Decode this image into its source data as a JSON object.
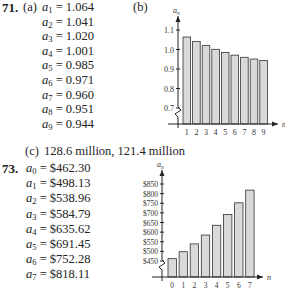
{
  "problem71": {
    "number": "71.",
    "part_a_label": "(a)",
    "part_b_label": "(b)",
    "part_c_label": "(c)",
    "part_c_text": "128.6 million, 121.4 million",
    "terms": [
      {
        "sub": "1",
        "value": "= 1.064"
      },
      {
        "sub": "2",
        "value": "= 1.041"
      },
      {
        "sub": "3",
        "value": "= 1.020"
      },
      {
        "sub": "4",
        "value": "= 1.001"
      },
      {
        "sub": "5",
        "value": "= 0.985"
      },
      {
        "sub": "6",
        "value": "= 0.971"
      },
      {
        "sub": "7",
        "value": "= 0.960"
      },
      {
        "sub": "8",
        "value": "= 0.951"
      },
      {
        "sub": "9",
        "value": "= 0.944"
      }
    ]
  },
  "problem73": {
    "number": "73.",
    "terms": [
      {
        "sub": "0",
        "value": "= $462.30"
      },
      {
        "sub": "1",
        "value": "= $498.13"
      },
      {
        "sub": "2",
        "value": "= $538.96"
      },
      {
        "sub": "3",
        "value": "= $584.79"
      },
      {
        "sub": "4",
        "value": "= $635.62"
      },
      {
        "sub": "5",
        "value": "= $691.45"
      },
      {
        "sub": "6",
        "value": "= $752.28"
      },
      {
        "sub": "7",
        "value": "= $818.11"
      }
    ]
  },
  "chart_data": [
    {
      "type": "bar",
      "title": "",
      "xlabel": "n",
      "ylabel": "a_n",
      "categories": [
        "1",
        "2",
        "3",
        "4",
        "5",
        "6",
        "7",
        "8",
        "9"
      ],
      "values": [
        1.064,
        1.041,
        1.02,
        1.001,
        0.985,
        0.971,
        0.96,
        0.951,
        0.944
      ],
      "ytick_labels": [
        "0.7",
        "0.8",
        "0.9",
        "1.0",
        "1.1"
      ],
      "ylim": [
        0.65,
        1.15
      ],
      "axis_break": true,
      "grid": false,
      "legend": null,
      "bar_color": "#d9d9d9"
    },
    {
      "type": "bar",
      "title": "",
      "xlabel": "n",
      "ylabel": "a_n",
      "categories": [
        "0",
        "1",
        "2",
        "3",
        "4",
        "5",
        "6",
        "7"
      ],
      "values": [
        462.3,
        498.13,
        538.96,
        584.79,
        635.62,
        691.45,
        752.28,
        818.11
      ],
      "ytick_labels": [
        "$450",
        "$500",
        "$550",
        "$600",
        "$650",
        "$700",
        "$750",
        "$800",
        "$850"
      ],
      "ylim": [
        400,
        880
      ],
      "axis_break": true,
      "grid": false,
      "legend": null,
      "bar_color": "#d9d9d9"
    }
  ]
}
